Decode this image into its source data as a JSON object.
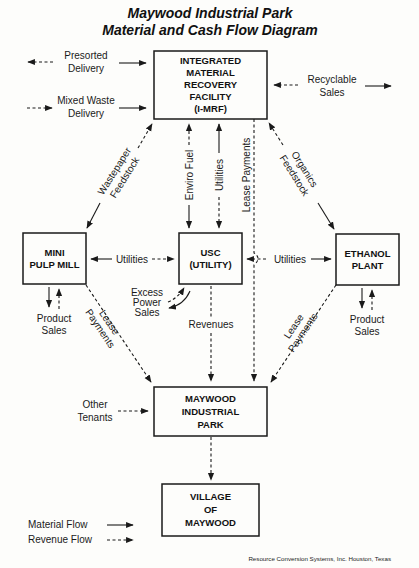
{
  "title": {
    "line1": "Maywood Industrial Park",
    "line2": "Material and Cash Flow Diagram"
  },
  "nodes": {
    "imrf": {
      "lines": [
        "INTEGRATED",
        "MATERIAL",
        "RECOVERY",
        "FACILITY",
        "(I-MRF)"
      ]
    },
    "pulp_mill": {
      "lines": [
        "MINI",
        "PULP MILL"
      ]
    },
    "usc": {
      "lines": [
        "USC",
        "(UTILITY)"
      ]
    },
    "ethanol": {
      "lines": [
        "ETHANOL",
        "PLANT"
      ]
    },
    "park": {
      "lines": [
        "MAYWOOD",
        "INDUSTRIAL",
        "PARK"
      ]
    },
    "village": {
      "lines": [
        "VILLAGE",
        "OF",
        "MAYWOOD"
      ]
    }
  },
  "edges": {
    "presorted": [
      "Presorted",
      "Delivery"
    ],
    "mixed_waste": [
      "Mixed Waste",
      "Delivery"
    ],
    "recyclable": [
      "Recyclable",
      "Sales"
    ],
    "wastepaper": [
      "Wastepaper",
      "Feedstock"
    ],
    "enviro_fuel": "Enviro Fuel",
    "utilities_top": "Utilities",
    "lease_top": "Lease Payments",
    "organics": [
      "Organics",
      "Feedstock"
    ],
    "utilities_left": "Utilities",
    "utilities_right": "Utilities",
    "excess_power": [
      "Excess",
      "Power",
      "Sales"
    ],
    "revenues": "Revenues",
    "product_left": [
      "Product",
      "Sales"
    ],
    "product_right": [
      "Product",
      "Sales"
    ],
    "lease_left": [
      "Lease",
      "Payments"
    ],
    "lease_right": [
      "Lease",
      "Payments"
    ],
    "other_tenants": [
      "Other",
      "Tenants"
    ]
  },
  "legend": {
    "material": "Material Flow",
    "revenue": "Revenue Flow"
  },
  "credit": "Resource Conversion Systems, Inc. Houston, Texas"
}
